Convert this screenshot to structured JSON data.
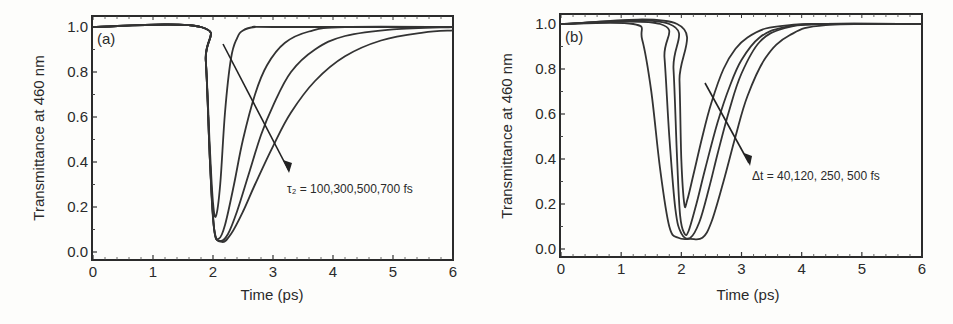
{
  "chart_data": [
    {
      "type": "line",
      "panel": "(a)",
      "title": "",
      "xlabel": "Time (ps)",
      "ylabel": "Transmittance at 460 nm",
      "xlim": [
        0,
        6
      ],
      "ylim": [
        0,
        1.05
      ],
      "xticks": [
        "0",
        "1",
        "2",
        "3",
        "4",
        "5",
        "6"
      ],
      "yticks": [
        "0.0",
        "0.2",
        "0.4",
        "0.6",
        "0.8",
        "1.0"
      ],
      "grid": false,
      "annotation": "τ₂ = 100,300,500,700 fs",
      "series": [
        {
          "name": "τ2 = 100 fs",
          "x": [
            0,
            1.8,
            1.88,
            1.95,
            2.0,
            2.05,
            2.12,
            2.2,
            2.3,
            2.4,
            2.5,
            2.7,
            3.0,
            6.0
          ],
          "y": [
            1.0,
            1.0,
            0.85,
            0.45,
            0.22,
            0.16,
            0.3,
            0.62,
            0.86,
            0.95,
            0.985,
            1.0,
            1.0,
            1.0
          ]
        },
        {
          "name": "τ2 = 300 fs",
          "x": [
            0,
            1.8,
            1.88,
            1.95,
            2.02,
            2.1,
            2.2,
            2.35,
            2.5,
            2.7,
            2.9,
            3.2,
            3.6,
            4.2,
            6.0
          ],
          "y": [
            1.0,
            1.0,
            0.85,
            0.4,
            0.1,
            0.06,
            0.12,
            0.3,
            0.5,
            0.7,
            0.83,
            0.93,
            0.98,
            1.0,
            1.0
          ]
        },
        {
          "name": "τ2 = 500 fs",
          "x": [
            0,
            1.8,
            1.88,
            1.95,
            2.02,
            2.12,
            2.25,
            2.4,
            2.6,
            2.8,
            3.0,
            3.3,
            3.7,
            4.2,
            5.0,
            6.0
          ],
          "y": [
            1.0,
            1.0,
            0.85,
            0.4,
            0.1,
            0.05,
            0.08,
            0.18,
            0.35,
            0.52,
            0.65,
            0.8,
            0.9,
            0.96,
            0.99,
            1.0
          ]
        },
        {
          "name": "τ2 = 700 fs",
          "x": [
            0,
            1.8,
            1.88,
            1.95,
            2.02,
            2.15,
            2.3,
            2.5,
            2.7,
            3.0,
            3.3,
            3.7,
            4.2,
            4.8,
            5.5,
            6.0
          ],
          "y": [
            1.0,
            1.0,
            0.85,
            0.4,
            0.1,
            0.045,
            0.08,
            0.18,
            0.3,
            0.47,
            0.62,
            0.76,
            0.87,
            0.94,
            0.975,
            0.985
          ]
        }
      ]
    },
    {
      "type": "line",
      "panel": "(b)",
      "title": "",
      "xlabel": "Time (ps)",
      "ylabel": "Transmittance at 460 nm",
      "xlim": [
        0,
        6
      ],
      "ylim": [
        0,
        1.05
      ],
      "xticks": [
        "0",
        "1",
        "2",
        "3",
        "4",
        "5",
        "6"
      ],
      "yticks": [
        "0.0",
        "0.2",
        "0.4",
        "0.6",
        "0.8",
        "1.0"
      ],
      "grid": false,
      "annotation": "Δt = 40,120, 250, 500 fs",
      "series": [
        {
          "name": "Δt = 40 fs",
          "x": [
            0,
            1.93,
            1.97,
            2.0,
            2.05,
            2.1,
            2.2,
            2.35,
            2.5,
            2.7,
            2.9,
            3.1,
            3.4,
            3.8,
            4.3,
            6.0
          ],
          "y": [
            1.0,
            1.0,
            0.75,
            0.4,
            0.2,
            0.22,
            0.33,
            0.5,
            0.65,
            0.8,
            0.89,
            0.94,
            0.98,
            0.995,
            1.0,
            1.0
          ]
        },
        {
          "name": "Δt = 120 fs",
          "x": [
            0,
            1.8,
            1.87,
            1.93,
            1.98,
            2.05,
            2.12,
            2.25,
            2.4,
            2.6,
            2.8,
            3.0,
            3.3,
            3.7,
            4.3,
            6.0
          ],
          "y": [
            1.0,
            1.0,
            0.8,
            0.4,
            0.15,
            0.07,
            0.08,
            0.2,
            0.36,
            0.56,
            0.72,
            0.84,
            0.94,
            0.985,
            1.0,
            1.0
          ]
        },
        {
          "name": "Δt = 250 fs",
          "x": [
            0,
            1.65,
            1.72,
            1.8,
            1.9,
            2.0,
            2.15,
            2.3,
            2.45,
            2.6,
            2.8,
            3.0,
            3.3,
            3.7,
            4.3,
            6.0
          ],
          "y": [
            1.0,
            1.0,
            0.85,
            0.5,
            0.18,
            0.07,
            0.05,
            0.12,
            0.26,
            0.42,
            0.62,
            0.78,
            0.92,
            0.98,
            1.0,
            1.0
          ]
        },
        {
          "name": "Δt = 500 fs",
          "x": [
            0,
            1.2,
            1.35,
            1.5,
            1.65,
            1.8,
            1.95,
            2.15,
            2.35,
            2.5,
            2.7,
            2.9,
            3.1,
            3.4,
            3.8,
            4.4,
            6.0
          ],
          "y": [
            1.0,
            1.0,
            0.93,
            0.7,
            0.35,
            0.1,
            0.05,
            0.045,
            0.05,
            0.12,
            0.3,
            0.5,
            0.68,
            0.85,
            0.95,
            0.995,
            1.0
          ]
        }
      ]
    }
  ]
}
